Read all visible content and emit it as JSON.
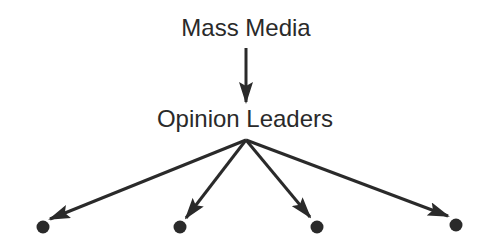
{
  "diagram": {
    "top_node": {
      "label": "Mass Media"
    },
    "middle_node": {
      "label": "Opinion Leaders"
    },
    "leaf_nodes": [
      {
        "id": "leaf-1"
      },
      {
        "id": "leaf-2"
      },
      {
        "id": "leaf-3"
      },
      {
        "id": "leaf-4"
      }
    ],
    "colors": {
      "stroke": "#2a2a2a",
      "background": "#ffffff"
    }
  }
}
